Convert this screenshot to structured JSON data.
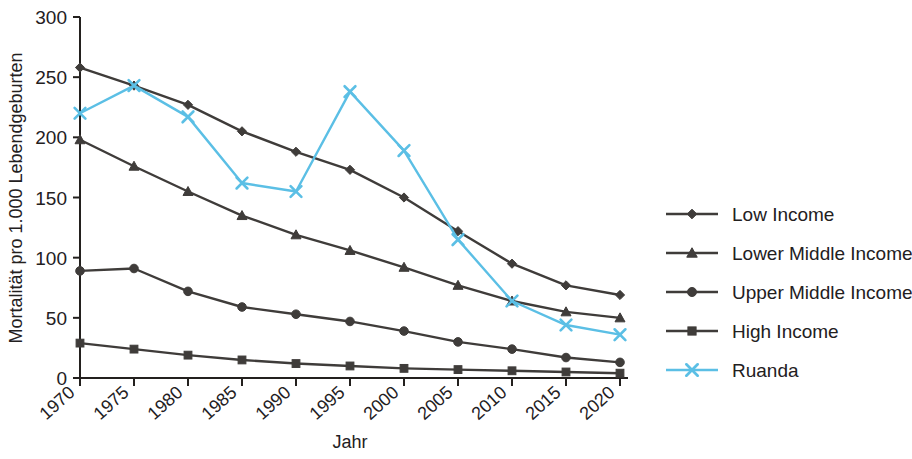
{
  "chart_data": {
    "type": "line",
    "title": "",
    "xlabel": "Jahr",
    "ylabel": "Mortalität pro 1.000 Lebendgeburten",
    "x": [
      1970,
      1975,
      1980,
      1985,
      1990,
      1995,
      2000,
      2005,
      2010,
      2015,
      2020
    ],
    "categories": [
      "1970",
      "1975",
      "1980",
      "1985",
      "1990",
      "1995",
      "2000",
      "2005",
      "2010",
      "2015",
      "2020"
    ],
    "xlim": [
      1970,
      2020
    ],
    "ylim": [
      0,
      300
    ],
    "yticks": [
      0,
      50,
      100,
      150,
      200,
      250,
      300
    ],
    "ytick_labels": [
      "0",
      "50",
      "100",
      "150",
      "200",
      "250",
      "300"
    ],
    "grid": false,
    "legend_position": "right",
    "series": [
      {
        "name": "Low Income",
        "marker": "diamond",
        "color": "#3f3c3a",
        "values": [
          258,
          243,
          227,
          205,
          188,
          173,
          150,
          122,
          95,
          77,
          69
        ]
      },
      {
        "name": "Lower Middle Income",
        "marker": "triangle",
        "color": "#3f3c3a",
        "values": [
          198,
          176,
          155,
          135,
          119,
          106,
          92,
          77,
          64,
          55,
          50
        ]
      },
      {
        "name": "Upper Middle Income",
        "marker": "circle",
        "color": "#3f3c3a",
        "values": [
          89,
          91,
          72,
          59,
          53,
          47,
          39,
          30,
          24,
          17,
          13
        ]
      },
      {
        "name": "High Income",
        "marker": "square",
        "color": "#3f3c3a",
        "values": [
          29,
          24,
          19,
          15,
          12,
          10,
          8,
          7,
          6,
          5,
          4
        ]
      },
      {
        "name": "Ruanda",
        "marker": "x",
        "color": "#5bbfe5",
        "values": [
          220,
          243,
          217,
          162,
          155,
          238,
          189,
          115,
          64,
          44,
          36
        ]
      }
    ]
  },
  "axes": {
    "y_axis_title": "Mortalität pro 1.000 Lebendgeburten",
    "x_axis_title": "Jahr"
  },
  "legend": {
    "items": [
      {
        "label": "Low Income",
        "marker": "diamond",
        "color": "#3f3c3a"
      },
      {
        "label": "Lower Middle Income",
        "marker": "triangle",
        "color": "#3f3c3a"
      },
      {
        "label": "Upper Middle Income",
        "marker": "circle",
        "color": "#3f3c3a"
      },
      {
        "label": "High Income",
        "marker": "square",
        "color": "#3f3c3a"
      },
      {
        "label": "Ruanda",
        "marker": "x",
        "color": "#5bbfe5"
      }
    ]
  },
  "colors": {
    "series_dark": "#3f3c3a",
    "ruanda_blue": "#5bbfe5",
    "axis": "#23201e",
    "background": "#ffffff"
  }
}
